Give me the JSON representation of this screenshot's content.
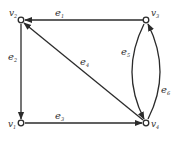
{
  "diagram": {
    "type": "directed-multigraph",
    "colors": {
      "stroke": "#2b2b2b",
      "text": "#333333",
      "background": "#ffffff"
    },
    "vertices": [
      {
        "id": "v1",
        "base": "v",
        "sub": "1",
        "x": 21,
        "y": 123
      },
      {
        "id": "v2",
        "base": "v",
        "sub": "2",
        "x": 21,
        "y": 20
      },
      {
        "id": "v3",
        "base": "v",
        "sub": "3",
        "x": 146,
        "y": 20
      },
      {
        "id": "v4",
        "base": "v",
        "sub": "4",
        "x": 146,
        "y": 123
      }
    ],
    "edges": [
      {
        "id": "e1",
        "base": "e",
        "sub": "1",
        "from": "v3",
        "to": "v2",
        "shape": "straight"
      },
      {
        "id": "e2",
        "base": "e",
        "sub": "2",
        "from": "v2",
        "to": "v1",
        "shape": "straight"
      },
      {
        "id": "e3",
        "base": "e",
        "sub": "3",
        "from": "v1",
        "to": "v4",
        "shape": "straight"
      },
      {
        "id": "e4",
        "base": "e",
        "sub": "4",
        "from": "v4",
        "to": "v2",
        "shape": "straight"
      },
      {
        "id": "e5",
        "base": "e",
        "sub": "5",
        "from": "v3",
        "to": "v4",
        "shape": "curve-left"
      },
      {
        "id": "e6",
        "base": "e",
        "sub": "6",
        "from": "v4",
        "to": "v3",
        "shape": "curve-right"
      }
    ]
  }
}
